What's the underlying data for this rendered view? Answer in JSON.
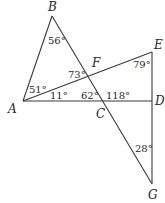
{
  "figure": {
    "points": [
      {
        "name": "A"
      },
      {
        "name": "B"
      },
      {
        "name": "C"
      },
      {
        "name": "D"
      },
      {
        "name": "E"
      },
      {
        "name": "F"
      },
      {
        "name": "G"
      }
    ],
    "segments": [
      "AB",
      "BG",
      "AD",
      "AE",
      "EG"
    ],
    "angles": [
      {
        "vertex": "B",
        "label": "56°"
      },
      {
        "vertex": "A",
        "between": "AB-AE",
        "label": "51°"
      },
      {
        "vertex": "A",
        "between": "AE-AD",
        "label": "11°"
      },
      {
        "vertex": "F",
        "label": "73°"
      },
      {
        "vertex": "C",
        "between": "CA-CF",
        "label": "62°"
      },
      {
        "vertex": "C",
        "between": "CF-CD",
        "label": "118°"
      },
      {
        "vertex": "E",
        "label": "79°"
      },
      {
        "vertex": "G",
        "label": "28°"
      }
    ]
  }
}
